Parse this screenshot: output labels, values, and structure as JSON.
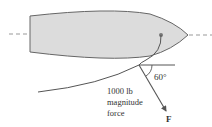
{
  "diagram": {
    "type": "free-body / force diagram",
    "angle_label": "60°",
    "force_text": {
      "line1": "1000 lb",
      "line2": "magnitude",
      "line3": "force"
    },
    "vector_label": "F",
    "colors": {
      "hull_fill": "#dcdcdc",
      "hull_stroke": "#666666",
      "lines": "#555555",
      "dashed_axis": "#999999",
      "text": "#333333"
    }
  }
}
